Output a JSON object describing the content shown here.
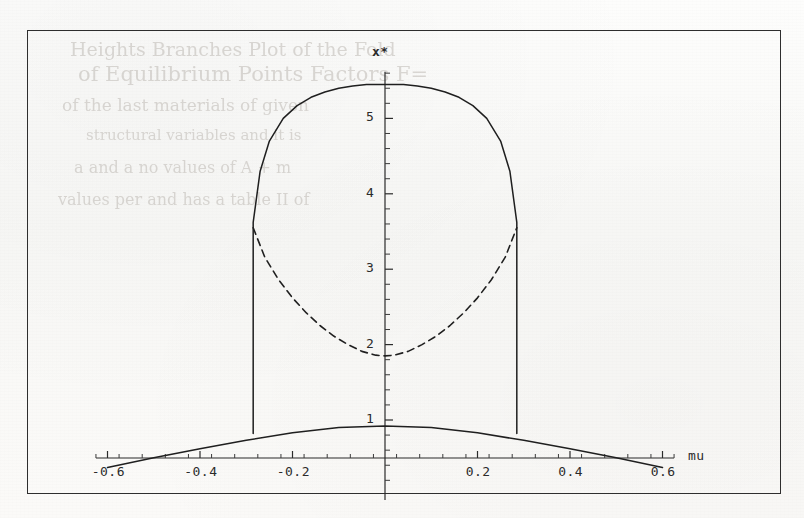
{
  "figure": {
    "kind": "bifurcation-diagram",
    "frame": {
      "x": 27,
      "y": 30,
      "width": 752,
      "height": 462
    },
    "background_note": "scanned book page with faint bleed-through text"
  },
  "axis_labels": {
    "x": "mu",
    "y": "x*"
  },
  "ticks": {
    "x_major": [
      "-0.6",
      "-0.4",
      "-0.2",
      "0.2",
      "0.4",
      "0.6"
    ],
    "y_major": [
      "1",
      "2",
      "3",
      "4",
      "5"
    ]
  },
  "ghost_text": {
    "lines": [
      {
        "t": "Heights  Branches  Plot  of  the  Fold",
        "x": 70,
        "y": 38,
        "s": 19
      },
      {
        "t": "of   Equilibrium  Points  Factors  F=",
        "x": 78,
        "y": 62,
        "s": 21
      },
      {
        "t": "of  the   last  materials   of   given",
        "x": 62,
        "y": 95,
        "s": 17
      },
      {
        "t": "structural   variables   and   it   is",
        "x": 86,
        "y": 126,
        "s": 15
      },
      {
        "t": "a  and   a  no   values   of    A  +  m",
        "x": 74,
        "y": 158,
        "s": 16
      },
      {
        "t": "values   per   and   has   a   table  II of",
        "x": 58,
        "y": 190,
        "s": 16
      }
    ]
  },
  "chart_data": {
    "type": "line",
    "title": "",
    "xlabel": "mu",
    "ylabel": "x*",
    "xlim": [
      -0.65,
      0.65
    ],
    "ylim": [
      0.0,
      5.75
    ],
    "xticks": [
      -0.6,
      -0.4,
      -0.2,
      0.0,
      0.2,
      0.4,
      0.6
    ],
    "xticklabels": [
      "-0.6",
      "-0.4",
      "-0.2",
      "",
      "0.2",
      "0.4",
      "0.6"
    ],
    "yticks": [
      1,
      2,
      3,
      4,
      5
    ],
    "yticklabels": [
      "1",
      "2",
      "3",
      "4",
      "5"
    ],
    "minor_tick_step_x": 0.05,
    "minor_tick_step_y": 0.2,
    "grid": false,
    "legend": null,
    "fold_points": [
      -0.285,
      0.285
    ],
    "series": [
      {
        "name": "upper stable branch",
        "style": "solid",
        "x": [
          -0.285,
          -0.285,
          -0.27,
          -0.25,
          -0.22,
          -0.19,
          -0.16,
          -0.13,
          -0.1,
          -0.07,
          -0.04,
          0.0,
          0.04,
          0.07,
          0.1,
          0.13,
          0.16,
          0.19,
          0.22,
          0.25,
          0.27,
          0.285,
          0.285
        ],
        "y": [
          0.82,
          3.62,
          4.3,
          4.7,
          5.0,
          5.17,
          5.28,
          5.35,
          5.4,
          5.43,
          5.45,
          5.45,
          5.45,
          5.43,
          5.4,
          5.35,
          5.28,
          5.17,
          5.0,
          4.7,
          4.3,
          3.62,
          0.82
        ]
      },
      {
        "name": "unstable branch",
        "style": "dashed",
        "x": [
          -0.285,
          -0.26,
          -0.23,
          -0.2,
          -0.17,
          -0.14,
          -0.11,
          -0.08,
          -0.05,
          -0.02,
          0.0,
          0.02,
          0.05,
          0.08,
          0.11,
          0.14,
          0.17,
          0.2,
          0.23,
          0.26,
          0.285
        ],
        "y": [
          3.55,
          3.16,
          2.86,
          2.62,
          2.42,
          2.25,
          2.11,
          2.0,
          1.91,
          1.86,
          1.85,
          1.86,
          1.91,
          2.0,
          2.11,
          2.25,
          2.42,
          2.62,
          2.86,
          3.16,
          3.55
        ]
      },
      {
        "name": "lower stable branch",
        "style": "solid",
        "x": [
          -0.6,
          -0.5,
          -0.4,
          -0.3,
          -0.2,
          -0.1,
          0.0,
          0.1,
          0.2,
          0.3,
          0.4,
          0.5,
          0.6
        ],
        "y": [
          0.37,
          0.5,
          0.62,
          0.73,
          0.83,
          0.9,
          0.92,
          0.9,
          0.83,
          0.73,
          0.62,
          0.5,
          0.37
        ]
      }
    ],
    "annotations": [
      {
        "kind": "vertical-fold-line",
        "x": -0.285,
        "y_from": 0.82,
        "y_to": 3.62
      },
      {
        "kind": "vertical-fold-line",
        "x": 0.285,
        "y_from": 0.82,
        "y_to": 3.62
      }
    ]
  }
}
